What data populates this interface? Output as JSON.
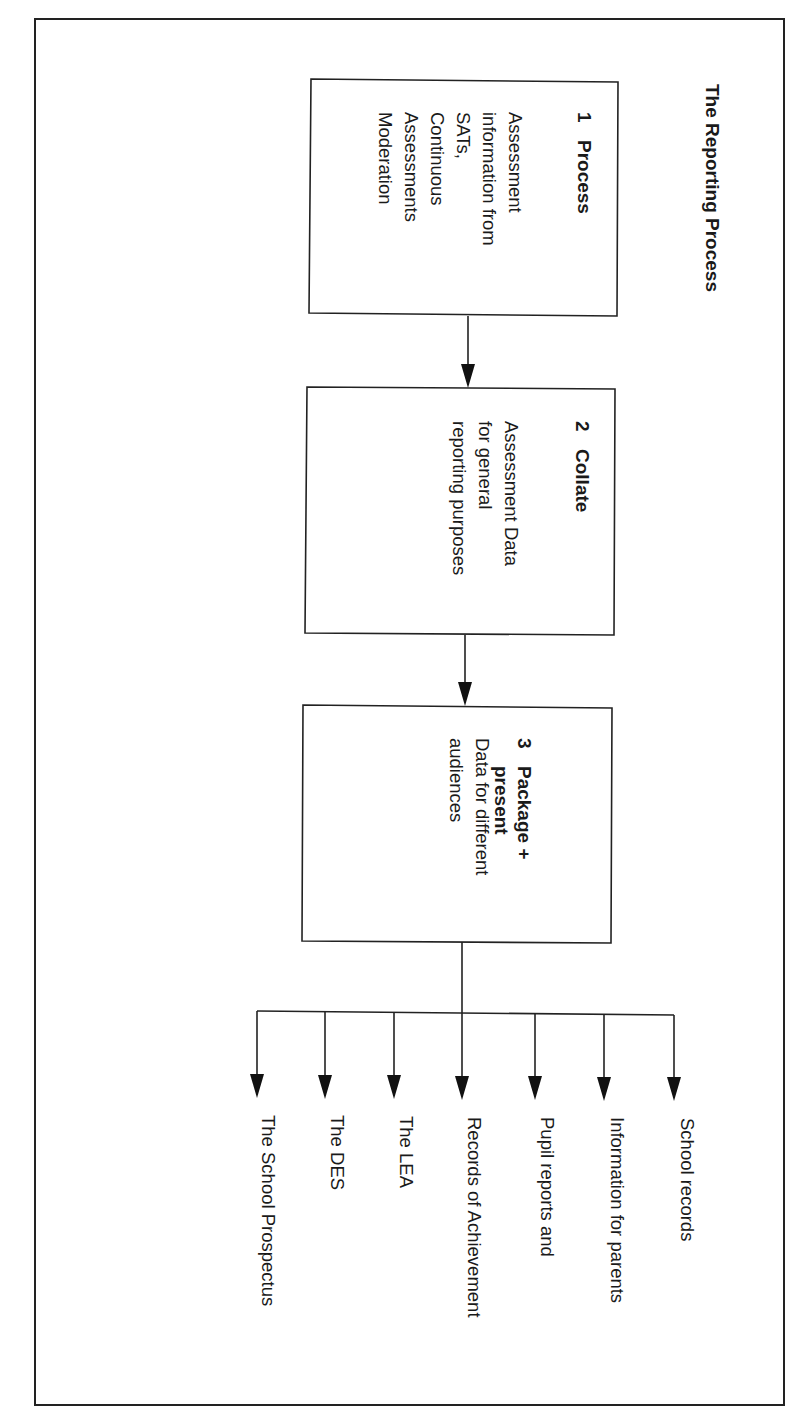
{
  "title": "The Reporting Process",
  "colors": {
    "ink": "#222222",
    "background": "#ffffff"
  },
  "steps": [
    {
      "number": "1",
      "heading_lines": [
        "Process"
      ],
      "body_lines": [
        "Assessment",
        "information from",
        "SATs,",
        "Continuous",
        "Assessments",
        "Moderation"
      ]
    },
    {
      "number": "2",
      "heading_lines": [
        "Collate"
      ],
      "body_lines": [
        "Assessment Data",
        "for general",
        "reporting purposes"
      ]
    },
    {
      "number": "3",
      "heading_lines": [
        "Package +",
        "present"
      ],
      "body_lines": [
        "Data for different",
        "audiences"
      ]
    }
  ],
  "outputs": [
    "School records",
    "Information for parents",
    "Pupil reports and",
    "Records of Achievement",
    "The LEA",
    "The DES",
    "The School Prospectus"
  ]
}
